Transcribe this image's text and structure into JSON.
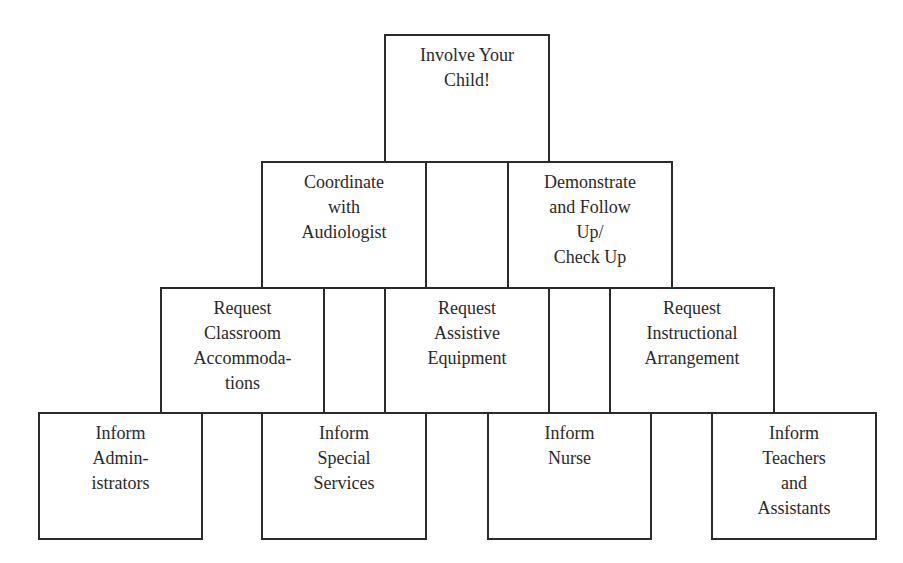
{
  "diagram": {
    "rows": [
      {
        "level": 1,
        "boxes": [
          {
            "id": "involve",
            "label": "Involve Your\nChild!"
          }
        ]
      },
      {
        "level": 2,
        "boxes": [
          {
            "id": "coordinate",
            "label": "Coordinate\nwith\nAudiologist"
          },
          {
            "id": "demonstrate",
            "label": "Demonstrate\nand Follow\nUp/\nCheck Up"
          }
        ]
      },
      {
        "level": 3,
        "boxes": [
          {
            "id": "req-classroom",
            "label": "Request\nClassroom\nAccommoda-\ntions"
          },
          {
            "id": "req-assistive",
            "label": "Request\nAssistive\nEquipment"
          },
          {
            "id": "req-instructional",
            "label": "Request\nInstructional\nArrangement"
          }
        ]
      },
      {
        "level": 4,
        "boxes": [
          {
            "id": "inform-admin",
            "label": "Inform\nAdmin-\nistrators"
          },
          {
            "id": "inform-special",
            "label": "Inform\nSpecial\nServices"
          },
          {
            "id": "inform-nurse",
            "label": "Inform\nNurse"
          },
          {
            "id": "inform-teachers",
            "label": "Inform\nTeachers\nand\nAssistants"
          }
        ]
      }
    ],
    "colors": {
      "stroke": "#2b2b2b",
      "text": "#2a2a2a",
      "background": "#ffffff"
    }
  }
}
